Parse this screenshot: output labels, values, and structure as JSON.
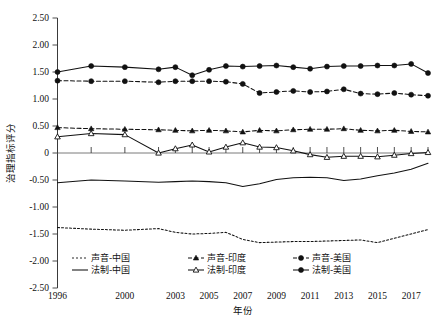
{
  "chart_data": {
    "type": "line",
    "title": "",
    "xlabel": "年份",
    "ylabel": "治理指标评分",
    "ylim": [
      -2.5,
      2.5
    ],
    "ytick_labels": [
      "2.50",
      "2.00",
      "1.50",
      "1.00",
      "0.50",
      "0",
      "-0.50",
      "-1.00",
      "-1.50",
      "-2.00",
      "-2.50"
    ],
    "ytick_values": [
      2.5,
      2.0,
      1.5,
      1.0,
      0.5,
      0,
      -0.5,
      -1.0,
      -1.5,
      -2.0,
      -2.5
    ],
    "grid": false,
    "legend_position": "bottom-inside",
    "x": [
      1996,
      1998,
      2000,
      2002,
      2003,
      2004,
      2005,
      2006,
      2007,
      2008,
      2009,
      2010,
      2011,
      2012,
      2013,
      2014,
      2015,
      2016,
      2017,
      2018
    ],
    "xtick_labels": [
      "1996",
      "2000",
      "2003",
      "2005",
      "2007",
      "2009",
      "2011",
      "2013",
      "2015",
      "2017"
    ],
    "xtick_values": [
      1996,
      2000,
      2003,
      2005,
      2007,
      2009,
      2011,
      2013,
      2015,
      2017
    ],
    "series": [
      {
        "name": "声音-中国",
        "key": "voice_china",
        "style": "dotted",
        "marker": "none",
        "values": [
          -1.38,
          -1.41,
          -1.43,
          -1.4,
          -1.47,
          -1.5,
          -1.49,
          -1.47,
          -1.6,
          -1.66,
          -1.65,
          -1.64,
          -1.64,
          -1.63,
          -1.62,
          -1.61,
          -1.66,
          -1.58,
          -1.5,
          -1.42
        ]
      },
      {
        "name": "声音-印度",
        "key": "voice_india",
        "style": "dashed",
        "marker": "triangle",
        "values": [
          0.47,
          0.45,
          0.44,
          0.43,
          0.42,
          0.41,
          0.42,
          0.41,
          0.39,
          0.42,
          0.41,
          0.43,
          0.44,
          0.44,
          0.45,
          0.42,
          0.41,
          0.42,
          0.4,
          0.39
        ]
      },
      {
        "name": "声音-美国",
        "key": "voice_usa",
        "style": "dashed",
        "marker": "circle",
        "values": [
          1.34,
          1.33,
          1.33,
          1.31,
          1.33,
          1.33,
          1.33,
          1.32,
          1.28,
          1.11,
          1.13,
          1.15,
          1.13,
          1.14,
          1.18,
          1.1,
          1.09,
          1.11,
          1.08,
          1.06
        ]
      },
      {
        "name": "法制-中国",
        "key": "law_china",
        "style": "solid",
        "marker": "none",
        "values": [
          -0.55,
          -0.5,
          -0.52,
          -0.54,
          -0.53,
          -0.52,
          -0.53,
          -0.55,
          -0.62,
          -0.57,
          -0.49,
          -0.46,
          -0.45,
          -0.46,
          -0.51,
          -0.48,
          -0.42,
          -0.37,
          -0.3,
          -0.19
        ]
      },
      {
        "name": "法制-印度",
        "key": "law_india",
        "style": "solid",
        "marker": "open-triangle",
        "values": [
          0.3,
          0.36,
          0.34,
          0.0,
          0.08,
          0.15,
          0.02,
          0.11,
          0.19,
          0.11,
          0.1,
          0.04,
          -0.03,
          -0.08,
          -0.06,
          -0.06,
          -0.07,
          -0.04,
          -0.01,
          0.01
        ]
      },
      {
        "name": "法制-美国",
        "key": "law_usa",
        "style": "solid",
        "marker": "circle",
        "values": [
          1.5,
          1.61,
          1.59,
          1.55,
          1.59,
          1.44,
          1.54,
          1.61,
          1.6,
          1.61,
          1.62,
          1.59,
          1.56,
          1.6,
          1.61,
          1.61,
          1.62,
          1.62,
          1.65,
          1.48
        ]
      }
    ],
    "legend": [
      {
        "label": "声音-中国",
        "style": "dotted",
        "marker": "none"
      },
      {
        "label": "声音-印度",
        "style": "dashed",
        "marker": "triangle"
      },
      {
        "label": "声音-美国",
        "style": "dashed",
        "marker": "circle"
      },
      {
        "label": "法制-中国",
        "style": "solid",
        "marker": "none"
      },
      {
        "label": "法制-印度",
        "style": "solid",
        "marker": "open-triangle"
      },
      {
        "label": "法制-美国",
        "style": "solid",
        "marker": "circle"
      }
    ],
    "colors": {
      "ink": "#111111",
      "axis": "#3a3a3a",
      "zero": "#6b6b6b"
    }
  }
}
